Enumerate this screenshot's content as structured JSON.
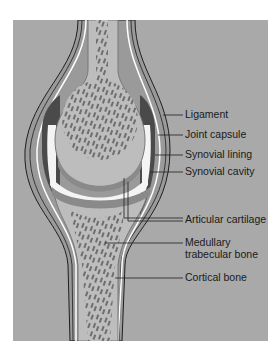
{
  "figure": {
    "colors": {
      "background": "#a9a9a9",
      "bone_matrix": "#bdbdbd",
      "trabecular": "#6e6e6e",
      "cartilage": "#8a8a8a",
      "capsule_dark": "#4a4a4a",
      "synovial_fluid": "#f4f4f4",
      "ligament": "#9a9a9a",
      "outline": "#1e1e1e"
    },
    "labels": [
      {
        "id": "ligament",
        "text": "Ligament"
      },
      {
        "id": "joint-capsule",
        "text": "Joint capsule"
      },
      {
        "id": "synovial-lining",
        "text": "Synovial lining"
      },
      {
        "id": "synovial-cavity",
        "text": "Synovial cavity"
      },
      {
        "id": "articular-cartilage",
        "text": "Articular cartilage"
      },
      {
        "id": "medullary-trabecular-bone",
        "text": "Medullary",
        "text2": "trabecular bone"
      },
      {
        "id": "cortical-bone",
        "text": "Cortical bone"
      }
    ]
  }
}
